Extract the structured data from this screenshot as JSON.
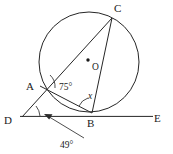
{
  "figure": {
    "type": "circle-geometry-diagram",
    "colors": {
      "stroke": "#262626",
      "text": "#1a1a1a",
      "background": "#ffffff"
    },
    "points": [
      {
        "id": "A",
        "label": "A",
        "x": 40,
        "y": 86,
        "label_x": 26,
        "label_y": 90
      },
      {
        "id": "B",
        "label": "B",
        "x": 92,
        "y": 113,
        "label_x": 89,
        "label_y": 126
      },
      {
        "id": "C",
        "label": "C",
        "x": 112,
        "y": 18,
        "label_x": 115,
        "label_y": 12
      },
      {
        "id": "D",
        "label": "D",
        "x": 22,
        "y": 117,
        "label_x": 6,
        "label_y": 124
      },
      {
        "id": "E",
        "label": "E",
        "x": 152,
        "y": 117,
        "label_x": 155,
        "label_y": 123
      },
      {
        "id": "O",
        "label": "O",
        "x": 88,
        "y": 60,
        "label_x": 92,
        "label_y": 70
      }
    ],
    "circle": {
      "cx": 89,
      "cy": 62,
      "r": 50
    },
    "segments": [
      {
        "name": "tangent-line-DE",
        "from": "D",
        "to": "E"
      },
      {
        "name": "secant-line-DC",
        "from": "D",
        "to": "C"
      },
      {
        "name": "chord-AB",
        "from": "A",
        "to": "B"
      },
      {
        "name": "chord-BC",
        "from": "B",
        "to": "C"
      }
    ],
    "angles": [
      {
        "name": "angle-at-A",
        "label": "75°",
        "vertex": "A",
        "label_x": 59,
        "label_y": 89
      },
      {
        "name": "angle-at-B",
        "label": "x",
        "vertex": "B",
        "label_x": 89,
        "label_y": 97
      },
      {
        "name": "angle-at-D",
        "label": "49°",
        "vertex": "D",
        "label_x": 62,
        "label_y": 146
      }
    ],
    "annotation": {
      "name": "leader-arrow-to-angle-D",
      "from_x": 84,
      "from_y": 138,
      "to_x": 44,
      "to_y": 114
    }
  }
}
